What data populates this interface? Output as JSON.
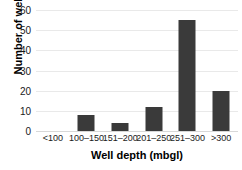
{
  "chart_data": {
    "type": "bar",
    "title": "",
    "xlabel": "Well depth (mbgl)",
    "ylabel": "Number of wells",
    "categories": [
      "<100",
      "100–150",
      "151–200",
      "201–250",
      "251–300",
      ">300"
    ],
    "values": [
      0,
      8,
      4,
      12,
      55,
      20
    ],
    "ylim": [
      0,
      60
    ],
    "yticks": [
      0,
      10,
      20,
      30,
      40,
      50,
      60
    ],
    "ytick_labels": [
      "0",
      "10",
      "20",
      "30",
      "40",
      "50",
      "60"
    ],
    "grid": true,
    "legend": null,
    "bar_color": "#3a3a3a",
    "gridline_color": "#e9e9e9",
    "background_color": "#ffffff"
  }
}
